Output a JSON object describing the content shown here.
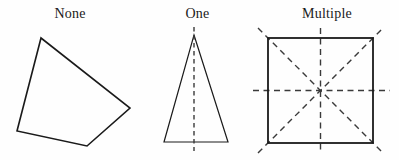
{
  "figure": {
    "title_visible": false,
    "background_color": "#fefefe",
    "stroke_color": "#1a1a1a",
    "dash_color": "#3a3a3a",
    "panels": [
      {
        "id": "none",
        "label": "None",
        "label_x": 70,
        "label_y": 14,
        "symmetry_count": 0,
        "shape": "irregular-quadrilateral",
        "polygon_points": "41,38 130,108 87,146 17,131",
        "symmetry_lines": []
      },
      {
        "id": "one",
        "label": "One",
        "label_x": 196,
        "label_y": 14,
        "symmetry_count": 1,
        "shape": "isosceles-triangle",
        "polygon_points": "194,35 228,142 164,142",
        "symmetry_lines": [
          {
            "name": "vertical",
            "x1": 194,
            "y1": 27,
            "x2": 194,
            "y2": 151
          }
        ]
      },
      {
        "id": "multiple",
        "label": "Multiple",
        "label_x": 320,
        "label_y": 14,
        "symmetry_count": 4,
        "shape": "square",
        "square": {
          "x": 268,
          "y": 38,
          "width": 105,
          "height": 105
        },
        "symmetry_lines": [
          {
            "name": "vertical",
            "x1": 320.5,
            "y1": 28,
            "x2": 320.5,
            "y2": 154
          },
          {
            "name": "horizontal",
            "x1": 253,
            "y1": 90.5,
            "x2": 390,
            "y2": 90.5
          },
          {
            "name": "diagonal-down",
            "x1": 258,
            "y1": 28,
            "x2": 383,
            "y2": 153
          },
          {
            "name": "diagonal-up",
            "x1": 258,
            "y1": 153,
            "x2": 383,
            "y2": 28
          }
        ]
      }
    ]
  }
}
